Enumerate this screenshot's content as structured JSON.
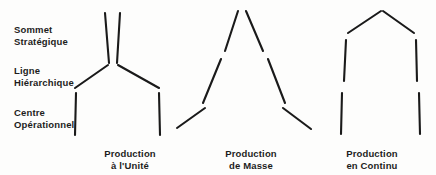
{
  "figure": {
    "background_color": "#fdfdfc",
    "line_color": "#1a1a1a",
    "text_color": "#1d1d1d"
  },
  "tier_labels": [
    {
      "id": "sommet",
      "text": "Sommet\nStratégique"
    },
    {
      "id": "ligne",
      "text": "Ligne\nHiérarchique"
    },
    {
      "id": "centre",
      "text": "Centre\nOpérationnel"
    }
  ],
  "captions": [
    {
      "id": "unite",
      "text": "Production\nà l'Unité"
    },
    {
      "id": "masse",
      "text": "Production\nde Masse"
    },
    {
      "id": "continu",
      "text": "Production\nen Continu"
    }
  ],
  "chart_data": {
    "type": "diagram",
    "title": "",
    "tiers": [
      "Sommet Stratégique",
      "Ligne Hiérarchique",
      "Centre Opérationnel"
    ],
    "shapes": [
      {
        "name": "Production à l'Unité",
        "segments": [
          {
            "tier": "Sommet Stratégique",
            "x1": 105,
            "y1": 13,
            "x2": 109,
            "y2": 63
          },
          {
            "tier": "Sommet Stratégique",
            "x1": 120,
            "y1": 13,
            "x2": 117,
            "y2": 63
          },
          {
            "tier": "Ligne Hiérarchique",
            "x1": 108,
            "y1": 65,
            "x2": 75,
            "y2": 88
          },
          {
            "tier": "Ligne Hiérarchique",
            "x1": 118,
            "y1": 65,
            "x2": 159,
            "y2": 88
          },
          {
            "tier": "Centre Opérationnel",
            "x1": 76,
            "y1": 93,
            "x2": 75,
            "y2": 135
          },
          {
            "tier": "Centre Opérationnel",
            "x1": 159,
            "y1": 93,
            "x2": 160,
            "y2": 135
          }
        ]
      },
      {
        "name": "Production de Masse",
        "segments": [
          {
            "tier": "Sommet Stratégique",
            "x1": 238,
            "y1": 11,
            "x2": 225,
            "y2": 51
          },
          {
            "tier": "Sommet Stratégique",
            "x1": 246,
            "y1": 11,
            "x2": 263,
            "y2": 51
          },
          {
            "tier": "Ligne Hiérarchique",
            "x1": 221,
            "y1": 59,
            "x2": 203,
            "y2": 103
          },
          {
            "tier": "Ligne Hiérarchique",
            "x1": 268,
            "y1": 59,
            "x2": 285,
            "y2": 103
          },
          {
            "tier": "Centre Opérationnel",
            "x1": 205,
            "y1": 108,
            "x2": 177,
            "y2": 128
          },
          {
            "tier": "Centre Opérationnel",
            "x1": 283,
            "y1": 108,
            "x2": 311,
            "y2": 129
          }
        ]
      },
      {
        "name": "Production en Continu",
        "segments": [
          {
            "tier": "Sommet Stratégique",
            "x1": 381,
            "y1": 11,
            "x2": 348,
            "y2": 33
          },
          {
            "tier": "Sommet Stratégique",
            "x1": 383,
            "y1": 11,
            "x2": 414,
            "y2": 33
          },
          {
            "tier": "Ligne Hiérarchique",
            "x1": 346,
            "y1": 40,
            "x2": 344,
            "y2": 81
          },
          {
            "tier": "Ligne Hiérarchique",
            "x1": 416,
            "y1": 40,
            "x2": 417,
            "y2": 81
          },
          {
            "tier": "Centre Opérationnel",
            "x1": 342,
            "y1": 93,
            "x2": 341,
            "y2": 134
          },
          {
            "tier": "Centre Opérationnel",
            "x1": 419,
            "y1": 93,
            "x2": 420,
            "y2": 134
          }
        ]
      }
    ]
  }
}
